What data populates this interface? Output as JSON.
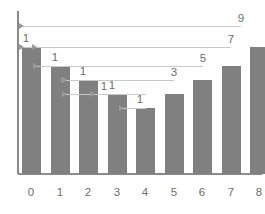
{
  "chart_data": {
    "type": "bar",
    "title": "",
    "subtitle": "",
    "xlabel": "",
    "ylabel": "",
    "grid": false,
    "legend": null,
    "categories": [
      "0",
      "1",
      "2",
      "3",
      "4",
      "5",
      "6",
      "7",
      "8"
    ],
    "x_tick_labels": [
      "0",
      "1",
      "2",
      "3",
      "4",
      "5",
      "6",
      "7",
      "8"
    ],
    "values": [
      5.0,
      4.0,
      3.3,
      2.7,
      2.0,
      3.0,
      4.3,
      5.7,
      7.0
    ],
    "bar_top_labels": [
      "1",
      "1",
      "1",
      "1",
      "1",
      "3",
      "5",
      "7",
      "9"
    ],
    "annotation_arrow_labels": [
      "1",
      "1",
      "1",
      "1",
      "1"
    ],
    "xlim": [
      -0.6,
      8.6
    ],
    "ylim": [
      0,
      7.9
    ],
    "colors": {
      "bar_fill": "#808080",
      "axis": "#8a8a8a",
      "connector_line": "#c9c9c9",
      "arrow_head": "#9a9a9a",
      "text": "#6e6e6e",
      "background": "#ffffff"
    },
    "annotations": [
      {
        "label": "9",
        "from_bar": 8,
        "to_x_axis": true,
        "note": "arrow from bar 8 top leftward to y-axis"
      },
      {
        "label": "7",
        "from_bar": 7,
        "to_bar": 0,
        "note": "arrow from bar 7 top leftward to bar 0 top"
      },
      {
        "label": "5",
        "from_bar": 6,
        "to_bar": 1,
        "note": "arrow from bar 6 top leftward to bar 1 top"
      },
      {
        "label": "3",
        "from_bar": 5,
        "to_bar": 2,
        "note": "arrow from bar 5 top leftward to bar 2 top"
      },
      {
        "label": "1",
        "from_bar": 4,
        "to_bar": 3,
        "note": "arrow from bar 4 top leftward to bar 3 top"
      },
      {
        "label": "1",
        "from_bar": 3,
        "to_bar": 2,
        "note": "short step arrow"
      },
      {
        "label": "1",
        "from_bar": 2,
        "to_bar": 1,
        "note": "short step arrow"
      },
      {
        "label": "1",
        "from_bar": 1,
        "to_bar": 0,
        "note": "short step arrow"
      },
      {
        "label": "1",
        "from_bar": 0,
        "to_axis": true,
        "note": "short step arrow to y-axis"
      }
    ]
  },
  "geometry": {
    "bar_x_left": [
      22,
      51,
      79,
      108,
      136,
      165,
      193,
      222,
      250
    ],
    "bar_width": 19,
    "baseline_y": 174,
    "bar_top_y": [
      47,
      66,
      80,
      94,
      108,
      94,
      80,
      66,
      47
    ],
    "axis_x": 18,
    "axis_top_y": 11,
    "axis_right_x": 262,
    "connectors": [
      {
        "y": 26,
        "x_right": 241,
        "x_left": 19,
        "label": "9",
        "label_x": 241,
        "label_y": 22
      },
      {
        "y": 47,
        "x_right": 231,
        "x_left": 32,
        "label": "7",
        "label_x": 231,
        "label_y": 43
      },
      {
        "y": 66,
        "x_right": 203,
        "x_left": 33,
        "label": "5",
        "label_x": 203,
        "label_y": 62
      },
      {
        "y": 80,
        "x_right": 174,
        "x_left": 61,
        "label": "3",
        "label_x": 174,
        "label_y": 76
      },
      {
        "y": 94,
        "x_right": 146,
        "x_left": 62,
        "label": "1",
        "label_x": 104,
        "label_y": 90
      }
    ],
    "step_connectors": [
      {
        "y": 47,
        "x_right": 32,
        "x_left": 19
      },
      {
        "y": 66,
        "x_right": 61,
        "x_left": 33
      },
      {
        "y": 80,
        "x_right": 89,
        "x_left": 62
      },
      {
        "y": 94,
        "x_right": 118,
        "x_left": 90
      },
      {
        "y": 108,
        "x_right": 146,
        "x_left": 119
      }
    ],
    "step_labels": [
      {
        "text": "1",
        "x": 26,
        "y": 42
      },
      {
        "text": "1",
        "x": 55,
        "y": 61
      },
      {
        "text": "1",
        "x": 83,
        "y": 75
      },
      {
        "text": "1",
        "x": 112,
        "y": 89
      },
      {
        "text": "1",
        "x": 140,
        "y": 103
      }
    ],
    "tick_label_y": 196,
    "tick_label_x": [
      31,
      60,
      88,
      117,
      145,
      174,
      202,
      231,
      259
    ]
  }
}
